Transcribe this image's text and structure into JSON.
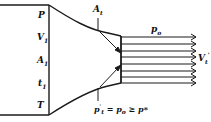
{
  "diagram": {
    "type": "converging nozzle discharging subsonic jet",
    "reservoir_labels": [
      {
        "id": "P",
        "text": "P"
      },
      {
        "id": "V1",
        "text": "V",
        "sub": "1"
      },
      {
        "id": "A1",
        "text": "A",
        "sub": "1"
      },
      {
        "id": "t1",
        "text": "t",
        "sub": "1"
      },
      {
        "id": "T",
        "text": "T"
      }
    ],
    "throat_label": {
      "text": "A",
      "sub": "t"
    },
    "exit_pressure_label": {
      "text": "p",
      "sub": "o"
    },
    "jet_velocity_label": {
      "text": "V",
      "sub": "t",
      "sup": "'"
    },
    "condition_label": {
      "p": "p",
      "prime": "'",
      "sub": "t",
      "eq": " = ",
      "po": "p",
      "po_sub": "o",
      "ge": " ≥ ",
      "pstar": "p*"
    },
    "jet_streamlines": 8,
    "line_color": "#1a1a1a"
  }
}
